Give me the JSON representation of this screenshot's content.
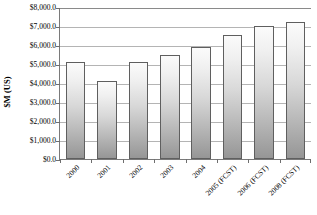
{
  "chart_data": {
    "type": "bar",
    "title": "",
    "subtitle": "",
    "xlabel": "",
    "ylabel": "$M (US)",
    "ylim": [
      0,
      8000
    ],
    "ytick_interval": 1000,
    "grid": true,
    "legend": "none",
    "categories": [
      "2000",
      "2001",
      "2002",
      "2003",
      "2004",
      "2005 (FCST)",
      "2006 (FCST)",
      "2008 (FCST)"
    ],
    "values": [
      5100,
      4100,
      5080,
      5450,
      5900,
      6520,
      7000,
      7200
    ],
    "ytick_labels": [
      "$8,000.0",
      "$7,000.0",
      "$6,000.0",
      "$5,000.0",
      "$4,000.0",
      "$3,000.0",
      "$2,000.0",
      "$1,000.0",
      "$0.0"
    ],
    "ytick_values": [
      8000,
      7000,
      6000,
      5000,
      4000,
      3000,
      2000,
      1000,
      0
    ],
    "colors": {
      "bar_top": "#fbfbfb",
      "bar_bottom": "#969696",
      "bar_border": "#5f5f5f",
      "gridline": "#b4b4b4",
      "axis": "#7a7a7a",
      "text": "#000000",
      "background": "#ffffff"
    }
  }
}
